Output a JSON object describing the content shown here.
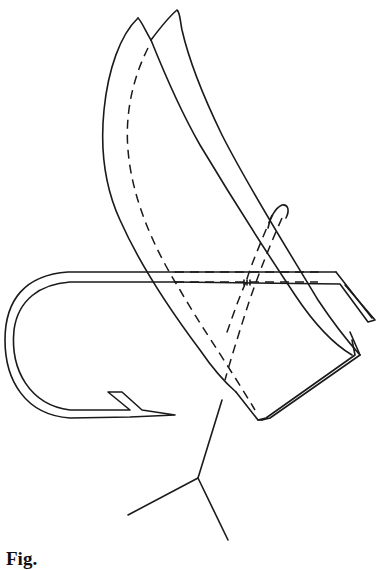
{
  "figure": {
    "stroke_color": "#1a1a1a",
    "background": "#ffffff",
    "parts": [
      {
        "name": "wing-left",
        "style": "solid"
      },
      {
        "name": "wing-right",
        "style": "solid"
      },
      {
        "name": "hook-bend-and-barb",
        "style": "solid"
      },
      {
        "name": "hook-eye-shank",
        "style": "solid"
      },
      {
        "name": "hidden-lines",
        "style": "dashed"
      },
      {
        "name": "leader-lines",
        "style": "solid"
      }
    ]
  },
  "caption": {
    "text": "Fig."
  }
}
